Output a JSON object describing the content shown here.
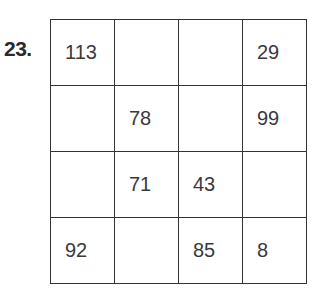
{
  "problem": {
    "number": "23."
  },
  "grid": {
    "rows": [
      [
        "113",
        "",
        "",
        "29"
      ],
      [
        "",
        "78",
        "",
        "99"
      ],
      [
        "",
        "71",
        "43",
        ""
      ],
      [
        "92",
        "",
        "85",
        "8"
      ]
    ]
  }
}
